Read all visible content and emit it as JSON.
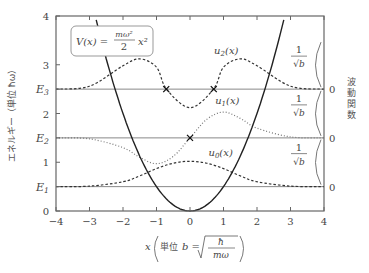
{
  "chart_data": {
    "type": "line",
    "title": "",
    "xlabel": "x (単位 b = √(ħ/mω))",
    "xlabel_parts": {
      "var": "x",
      "unit_prefix": "単位",
      "unit_var": "b",
      "eq": "=",
      "numer": "ħ",
      "denom": "mω"
    },
    "ylabel": "エネルギー（単位 ħω）",
    "ylabel_right": "波動関数",
    "xlim": [
      -4,
      4
    ],
    "ylim": [
      0,
      4
    ],
    "x_ticks": [
      "-4",
      "-3",
      "-2",
      "-1",
      "0",
      "1",
      "2",
      "3",
      "4"
    ],
    "y_ticks": [
      "0",
      "1",
      "2",
      "3",
      "4"
    ],
    "y_level_ticks": [
      {
        "label": "E",
        "sub": "1",
        "value": 0.5
      },
      {
        "label": "E",
        "sub": "2",
        "value": 1.5
      },
      {
        "label": "E",
        "sub": "3",
        "value": 2.5
      }
    ],
    "grid": false,
    "potential": {
      "name": "V(x) = (mω²/2) x²",
      "formula_parts": {
        "lhs": "V(x) =",
        "numer": "mω²",
        "denom": "2",
        "rhs": "x²"
      },
      "function": "0.5*x^2",
      "style": "solid"
    },
    "series": [
      {
        "name": "u0(x)",
        "label": "u",
        "sub": "0",
        "baseline": 0.5,
        "style": "dashed",
        "scale_label": "1/√b",
        "x": [
          -4,
          -3,
          -2,
          -1.5,
          -1,
          -0.5,
          0,
          0.5,
          1,
          1.5,
          2,
          3,
          4
        ],
        "values": [
          0.5,
          0.51,
          0.6,
          0.72,
          0.87,
          0.98,
          1.02,
          0.98,
          0.87,
          0.72,
          0.6,
          0.51,
          0.5
        ]
      },
      {
        "name": "u1(x)",
        "label": "u",
        "sub": "1",
        "baseline": 1.5,
        "style": "dotted",
        "scale_label": "1/√b",
        "x": [
          -4,
          -3,
          -2,
          -1.5,
          -1,
          -0.5,
          0,
          0.5,
          1,
          1.5,
          2,
          3,
          4
        ],
        "values": [
          1.5,
          1.48,
          1.3,
          1.1,
          0.97,
          1.12,
          1.5,
          1.88,
          2.03,
          1.9,
          1.7,
          1.52,
          1.5
        ]
      },
      {
        "name": "u2(x)",
        "label": "u",
        "sub": "2",
        "baseline": 2.5,
        "style": "dashed",
        "scale_label": "1/√b",
        "x": [
          -4,
          -3,
          -2,
          -1.5,
          -1,
          -0.7,
          0,
          0.7,
          1,
          1.5,
          2,
          3,
          4
        ],
        "values": [
          2.5,
          2.56,
          2.98,
          3.12,
          2.95,
          2.5,
          2.12,
          2.5,
          2.95,
          3.12,
          2.98,
          2.56,
          2.5
        ]
      }
    ],
    "annotations": [
      {
        "type": "cross",
        "x": -0.71,
        "y": 2.5
      },
      {
        "type": "cross",
        "x": 0.71,
        "y": 2.5
      },
      {
        "type": "cross",
        "x": 0.0,
        "y": 1.5
      }
    ],
    "right_axis_zero_label": "0"
  }
}
